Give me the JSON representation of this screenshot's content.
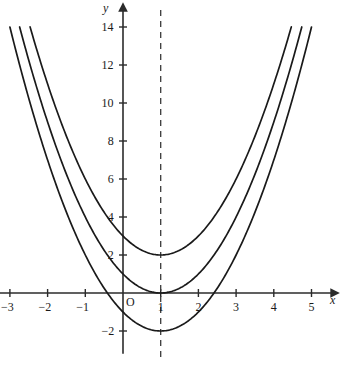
{
  "chart_data": {
    "type": "line",
    "title": "",
    "subtitle": "",
    "xlabel": "x",
    "ylabel": "y",
    "xlim": [
      -3.3,
      5.7
    ],
    "ylim": [
      -3.2,
      15.2
    ],
    "grid": false,
    "legend": null,
    "x_ticks": [
      -3,
      -2,
      -1,
      1,
      2,
      3,
      4,
      5
    ],
    "x_tick_labels": [
      "−3",
      "−2",
      "−1",
      "1",
      "2",
      "3",
      "4",
      "5"
    ],
    "y_ticks": [
      -2,
      2,
      4,
      6,
      8,
      10,
      12,
      14
    ],
    "y_tick_labels": [
      "−2",
      "2",
      "4",
      "6",
      "8",
      "10",
      "12",
      "14"
    ],
    "origin_label": "O",
    "annotations": [
      {
        "name": "axis-of-symmetry",
        "type": "vertical-dashed-line",
        "x": 1,
        "label": ""
      }
    ],
    "series": [
      {
        "name": "y = (x - 1)^2 + 2",
        "vertex": [
          1,
          2
        ],
        "a": 1,
        "h": 1,
        "k": 2,
        "x_range": [
          -2.465,
          4.465
        ],
        "x": [
          -2.465,
          -2.0,
          -1.5,
          -1.0,
          -0.5,
          0.0,
          0.5,
          1.0,
          1.5,
          2.0,
          2.5,
          3.0,
          3.5,
          4.0,
          4.465
        ],
        "y": [
          14.0,
          11.0,
          8.25,
          6.0,
          4.25,
          3.0,
          2.25,
          2.0,
          2.25,
          3.0,
          4.25,
          6.0,
          8.25,
          11.0,
          14.0
        ]
      },
      {
        "name": "y = (x - 1)^2",
        "vertex": [
          1,
          0
        ],
        "a": 1,
        "h": 1,
        "k": 0,
        "x_range": [
          -2.742,
          4.742
        ],
        "x": [
          -2.742,
          -2.5,
          -2.0,
          -1.5,
          -1.0,
          -0.5,
          0.0,
          0.5,
          1.0,
          1.5,
          2.0,
          2.5,
          3.0,
          3.5,
          4.0,
          4.5,
          4.742
        ],
        "y": [
          14.0,
          12.25,
          9.0,
          6.25,
          4.0,
          2.25,
          1.0,
          0.25,
          0.0,
          0.25,
          1.0,
          2.25,
          4.0,
          6.25,
          9.0,
          12.25,
          14.0
        ]
      },
      {
        "name": "y = (x - 1)^2 - 2",
        "vertex": [
          1,
          -2
        ],
        "a": 1,
        "h": 1,
        "k": -2,
        "x_range": [
          -3.0,
          5.0
        ],
        "x_intercepts": [
          -0.414,
          2.414
        ],
        "x": [
          -3.0,
          -2.5,
          -2.0,
          -1.5,
          -1.0,
          -0.5,
          0.0,
          0.5,
          1.0,
          1.5,
          2.0,
          2.5,
          3.0,
          3.5,
          4.0,
          4.5,
          5.0
        ],
        "y": [
          14.0,
          10.25,
          7.0,
          4.25,
          2.0,
          0.25,
          -1.0,
          -1.75,
          -2.0,
          -1.75,
          -1.0,
          0.25,
          2.0,
          4.25,
          7.0,
          10.25,
          14.0
        ]
      }
    ],
    "colors": {
      "curve": "#1a1a1a",
      "axis": "#2b2b2b",
      "dashed": "#3a3a3a",
      "background": "#ffffff"
    }
  }
}
